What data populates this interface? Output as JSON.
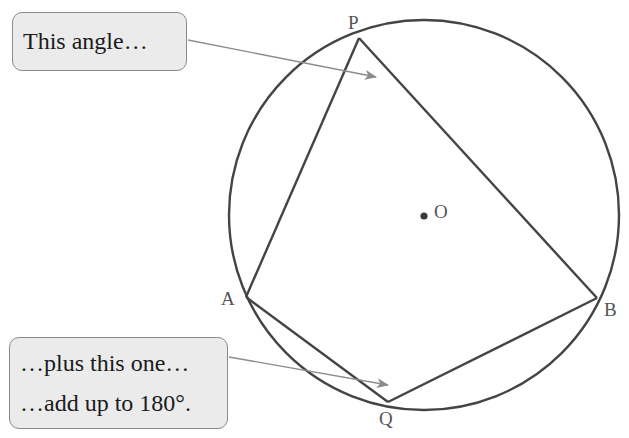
{
  "diagram": {
    "colors": {
      "stroke": "#444444",
      "arrow": "#8c8c8c",
      "callout_fill": "#ebebeb",
      "callout_border": "#8a8a8a",
      "label": "#555555"
    },
    "circle": {
      "center_label": "O",
      "cx": 424,
      "cy": 215,
      "r": 195
    },
    "points": {
      "P": {
        "label": "P",
        "x": 359,
        "y": 38
      },
      "A": {
        "label": "A",
        "x": 246,
        "y": 297
      },
      "Q": {
        "label": "Q",
        "x": 388,
        "y": 402
      },
      "B": {
        "label": "B",
        "x": 597,
        "y": 298
      }
    },
    "quadrilateral_order": [
      "P",
      "B",
      "Q",
      "A"
    ]
  },
  "callouts": {
    "top": {
      "lines": [
        "This angle…"
      ],
      "points_to": "angle at P"
    },
    "bottom": {
      "lines": [
        "…plus this one…",
        "…add up to 180°."
      ],
      "points_to": "angle at Q"
    }
  }
}
